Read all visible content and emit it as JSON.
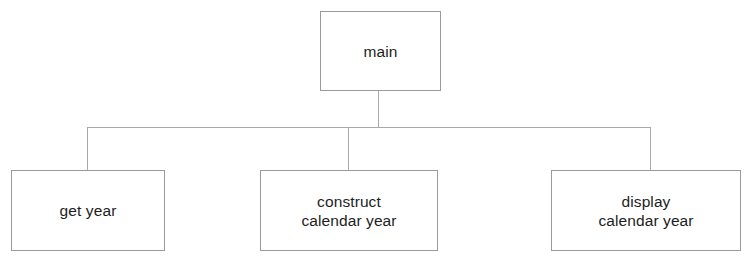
{
  "diagram": {
    "type": "structure-chart",
    "title": "main",
    "nodes": [
      {
        "id": "main",
        "label": "main",
        "level": 0
      },
      {
        "id": "get_year",
        "label": "get year",
        "level": 1
      },
      {
        "id": "construct",
        "label": "construct\ncalendar year",
        "level": 1
      },
      {
        "id": "display",
        "label": "display\ncalendar year",
        "level": 1
      }
    ],
    "edges": [
      {
        "from": "main",
        "to": "get_year"
      },
      {
        "from": "main",
        "to": "construct"
      },
      {
        "from": "main",
        "to": "display"
      }
    ],
    "colors": {
      "background": "#ffffff",
      "box_border": "#9a9a9a",
      "connector_line": "#a8a8a8",
      "text": "#1d1d1d"
    }
  }
}
